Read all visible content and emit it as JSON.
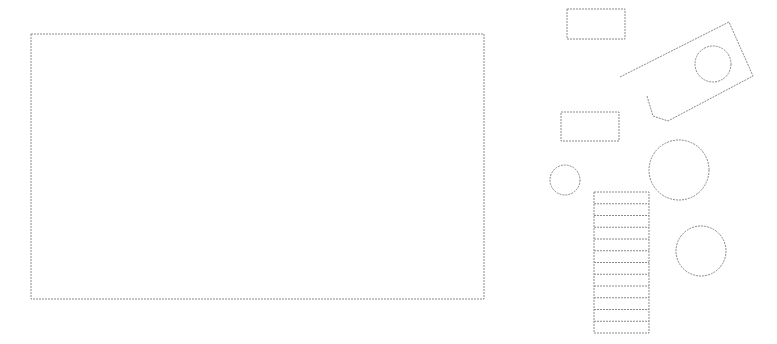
{
  "canvas": {
    "width": 777,
    "height": 344,
    "background": "#ffffff",
    "stroke": "#8a8a8a"
  },
  "shapes": {
    "large_rect": {
      "x": 31,
      "y": 34,
      "w": 453,
      "h": 265
    },
    "small_rect_top": {
      "x": 567,
      "y": 9,
      "w": 58,
      "h": 30
    },
    "small_rect_mid": {
      "x": 561,
      "y": 112,
      "w": 58,
      "h": 29
    },
    "tilted_shape": {
      "points": "620,77 729,22 753,76 668,121 653,116 647,96",
      "hole": {
        "cx": 713,
        "cy": 64,
        "r": 18
      }
    },
    "circle_small": {
      "cx": 565,
      "cy": 180,
      "r": 15
    },
    "circle_large": {
      "cx": 679,
      "cy": 170,
      "r": 30
    },
    "circle_lower": {
      "cx": 701,
      "cy": 251,
      "r": 25
    },
    "stair": {
      "x": 594,
      "y": 192,
      "w": 55,
      "h": 141,
      "steps": 12
    }
  }
}
